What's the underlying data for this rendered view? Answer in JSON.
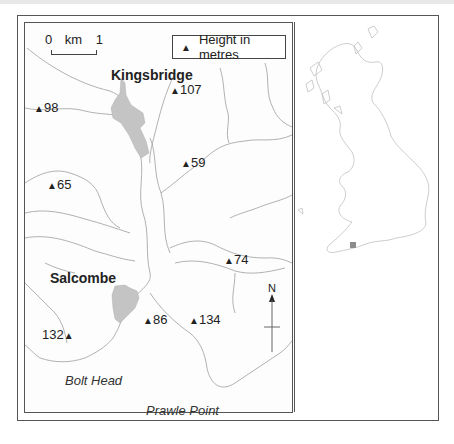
{
  "map": {
    "legend": {
      "icon": "triangle-icon",
      "label": "Height in metres"
    },
    "scale": {
      "start": "0",
      "unit": "km",
      "end": "1"
    },
    "towns": [
      {
        "name": "Kingsbridge"
      },
      {
        "name": "Salcombe"
      }
    ],
    "places": [
      {
        "name": "Bolt Head"
      },
      {
        "name": "Prawle Point"
      }
    ],
    "spot_heights": [
      {
        "value": "107"
      },
      {
        "value": "98"
      },
      {
        "value": "59"
      },
      {
        "value": "65"
      },
      {
        "value": "74"
      },
      {
        "value": "86"
      },
      {
        "value": "134"
      },
      {
        "value": "132"
      }
    ],
    "north_arrow": {
      "label": "N"
    },
    "triangle": "▲",
    "colors": {
      "town_fill": "#c4c4c4",
      "line": "#9a9a9a",
      "frame": "#555555"
    }
  },
  "inset": {
    "title": "",
    "highlight_color": "#8c8c8c"
  }
}
